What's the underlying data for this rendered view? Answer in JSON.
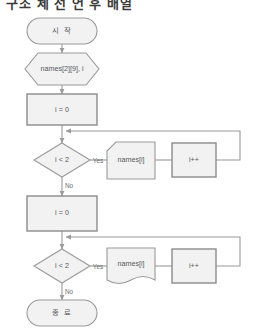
{
  "title": "구조 체 선 언 후 배열",
  "colors": {
    "node_fill": "#f2f2f2",
    "node_stroke": "#9a9a9a",
    "edge_stroke": "#9a9a9a",
    "text": "#55595c",
    "label_text": "#6b6f72",
    "background": "#ffffff"
  },
  "nodes": {
    "start": {
      "label": "시 작",
      "shape": "terminator"
    },
    "declare": {
      "label": "names[2][9], i",
      "shape": "hexagon-preparation"
    },
    "init1": {
      "label": "i = 0",
      "shape": "process"
    },
    "cond1": {
      "label": "i < 2",
      "shape": "decision"
    },
    "out1": {
      "label": "names[i]",
      "shape": "clipped-corner-card"
    },
    "inc1": {
      "label": "i++",
      "shape": "process"
    },
    "init2": {
      "label": "i = 0",
      "shape": "process"
    },
    "cond2": {
      "label": "i < 2",
      "shape": "decision"
    },
    "out2": {
      "label": "names[i]",
      "shape": "document-wavy"
    },
    "inc2": {
      "label": "i++",
      "shape": "process"
    },
    "end": {
      "label": "종 료",
      "shape": "terminator"
    }
  },
  "edge_labels": {
    "yes1": "Yes",
    "no1": "No",
    "yes2": "Yes",
    "no2": "No"
  }
}
